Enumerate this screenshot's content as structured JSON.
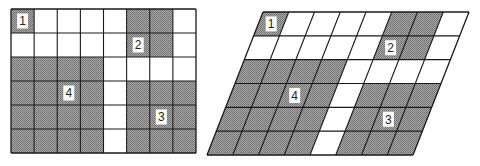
{
  "diagram": {
    "columns": 8,
    "rows": 6,
    "shade_color": "#8c8c8c",
    "line_color": "#1a1a1a",
    "background_color": "#ffffff",
    "shaded_cells": [
      [
        1,
        0,
        0,
        0,
        0,
        1,
        1,
        0
      ],
      [
        0,
        0,
        0,
        0,
        0,
        1,
        1,
        0
      ],
      [
        1,
        1,
        1,
        1,
        0,
        0,
        0,
        0
      ],
      [
        1,
        1,
        1,
        1,
        0,
        1,
        1,
        1
      ],
      [
        1,
        1,
        1,
        1,
        0,
        1,
        1,
        1
      ],
      [
        1,
        1,
        1,
        1,
        0,
        1,
        1,
        1
      ]
    ],
    "regions": [
      {
        "label": "1",
        "row": 0,
        "col": 0
      },
      {
        "label": "2",
        "row": 1,
        "col": 5
      },
      {
        "label": "3",
        "row": 4,
        "col": 6
      },
      {
        "label": "4",
        "row": 3,
        "col": 2
      }
    ],
    "panels": [
      {
        "name": "rectangle-grid",
        "top_left": [
          11,
          9
        ],
        "top_right": [
          196,
          9
        ],
        "bottom_left": [
          11,
          153
        ]
      },
      {
        "name": "parallelogram-grid",
        "top_left": [
          263,
          12
        ],
        "top_right": [
          469,
          12
        ],
        "bottom_left": [
          207,
          155
        ]
      }
    ]
  }
}
